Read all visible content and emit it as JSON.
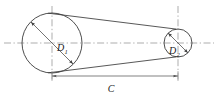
{
  "figure": {
    "background_color": "#ffffff",
    "line_color": "#3a3a3a",
    "centerline_color": "#8a8a8a",
    "text_color": "#1a1a1a",
    "width": 218,
    "height": 98
  },
  "labels": {
    "driver_diameter": "D",
    "driver_diameter_subscript": "1",
    "driven_diameter": "D",
    "driven_diameter_subscript": "2",
    "center_distance": "C"
  },
  "geometry": {
    "large_pulley": {
      "name": "large-pulley",
      "cx": 52,
      "cy": 43,
      "r": 30
    },
    "small_pulley": {
      "name": "small-pulley",
      "cx": 178,
      "cy": 43,
      "r": 14
    },
    "horizontal_centerline": {
      "x1": 4,
      "y1": 43,
      "x2": 214,
      "y2": 43
    },
    "vertical_centerline_left": {
      "x": 52,
      "y1": 6,
      "y2": 81
    },
    "vertical_centerline_right": {
      "x": 178,
      "y1": 6,
      "y2": 81
    },
    "belt_upper": {
      "x1": 48.2,
      "y1": 13.2,
      "x2": 176.2,
      "y2": 29.1
    },
    "belt_lower": {
      "x1": 48.2,
      "y1": 72.8,
      "x2": 176.2,
      "y2": 56.9
    },
    "diameter_arrow_large": {
      "x1": 31.0,
      "y1": 22.0,
      "x2": 73.0,
      "y2": 64.0
    },
    "diameter_arrow_small": {
      "x1": 168.1,
      "y1": 33.1,
      "x2": 187.9,
      "y2": 52.9
    },
    "dimension_line": {
      "x1": 52,
      "y1": 70,
      "x2": 178,
      "y2": 70
    },
    "label_positions": {
      "D1": {
        "x": 57,
        "y": 49
      },
      "D1_sub": {
        "x": 64,
        "y": 52
      },
      "D2": {
        "x": 170,
        "y": 52
      },
      "D2_sub": {
        "x": 177,
        "y": 55
      },
      "C": {
        "x": 111,
        "y": 87
      }
    }
  }
}
